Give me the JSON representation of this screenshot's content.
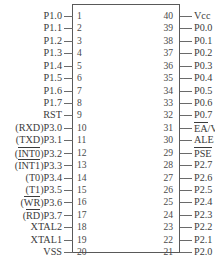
{
  "diagram": {
    "package_pin_count": 40,
    "colors": {
      "body_border": "#595959",
      "lead": "#6a6a6a",
      "text": "#3b3b3b",
      "pin_number": "#4a4a4a",
      "background": "#ffffff"
    }
  },
  "left_pins": [
    {
      "number": "1",
      "pre": "",
      "pre_bar": "",
      "post": "P1.0"
    },
    {
      "number": "2",
      "pre": "",
      "pre_bar": "",
      "post": "P1.1"
    },
    {
      "number": "3",
      "pre": "",
      "pre_bar": "",
      "post": "P1.2"
    },
    {
      "number": "4",
      "pre": "",
      "pre_bar": "",
      "post": "P1.3"
    },
    {
      "number": "5",
      "pre": "",
      "pre_bar": "",
      "post": "P1.4"
    },
    {
      "number": "6",
      "pre": "",
      "pre_bar": "",
      "post": "P1.5"
    },
    {
      "number": "7",
      "pre": "",
      "pre_bar": "",
      "post": "P1.6"
    },
    {
      "number": "8",
      "pre": "",
      "pre_bar": "",
      "post": "P1.7"
    },
    {
      "number": "9",
      "pre": "",
      "pre_bar": "",
      "post": "RST"
    },
    {
      "number": "10",
      "pre": "(RXD)",
      "pre_bar": "",
      "post": "P3.0"
    },
    {
      "number": "11",
      "pre": "(TXD)",
      "pre_bar": "",
      "post": "P3.1"
    },
    {
      "number": "12",
      "pre": "(",
      "pre_bar": "INT0",
      "post": ")P3.2"
    },
    {
      "number": "13",
      "pre": "(",
      "pre_bar": "INT1",
      "post": ")P3.3"
    },
    {
      "number": "14",
      "pre": "(T0)",
      "pre_bar": "",
      "post": "P3.4"
    },
    {
      "number": "15",
      "pre": "(T1)",
      "pre_bar": "",
      "post": "P3.5"
    },
    {
      "number": "16",
      "pre": "(",
      "pre_bar": "WR",
      "post": ")P3.6"
    },
    {
      "number": "17",
      "pre": "(",
      "pre_bar": "RD",
      "post": ")P3.7"
    },
    {
      "number": "18",
      "pre": "",
      "pre_bar": "",
      "post": "XTAL2"
    },
    {
      "number": "19",
      "pre": "",
      "pre_bar": "",
      "post": "XTAL1"
    },
    {
      "number": "20",
      "pre": "",
      "pre_bar": "",
      "post": "VSS"
    }
  ],
  "right_pins": [
    {
      "number": "40",
      "bar": "",
      "post": "Vcc"
    },
    {
      "number": "39",
      "bar": "",
      "post": "P0.0"
    },
    {
      "number": "38",
      "bar": "",
      "post": "P0.1"
    },
    {
      "number": "37",
      "bar": "",
      "post": "P0.2"
    },
    {
      "number": "36",
      "bar": "",
      "post": "P0.3"
    },
    {
      "number": "35",
      "bar": "",
      "post": "P0.4"
    },
    {
      "number": "34",
      "bar": "",
      "post": "P0.5"
    },
    {
      "number": "33",
      "bar": "",
      "post": "P0.6"
    },
    {
      "number": "32",
      "bar": "",
      "post": "P0.7"
    },
    {
      "number": "31",
      "bar": "EA",
      "post": "/V"
    },
    {
      "number": "30",
      "bar": "",
      "post": "ALE"
    },
    {
      "number": "29",
      "bar": "PSE",
      "post": ""
    },
    {
      "number": "28",
      "bar": "",
      "post": "P2.7"
    },
    {
      "number": "27",
      "bar": "",
      "post": "P2.6"
    },
    {
      "number": "26",
      "bar": "",
      "post": "P2.5"
    },
    {
      "number": "25",
      "bar": "",
      "post": "P2.4"
    },
    {
      "number": "24",
      "bar": "",
      "post": "P2.3"
    },
    {
      "number": "23",
      "bar": "",
      "post": "P2.2"
    },
    {
      "number": "22",
      "bar": "",
      "post": "P2.1"
    },
    {
      "number": "21",
      "bar": "",
      "post": "P2.0"
    }
  ]
}
